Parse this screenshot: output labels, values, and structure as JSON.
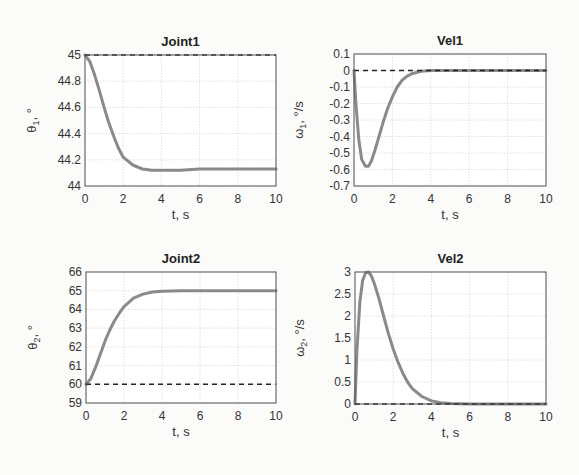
{
  "chart_data": [
    {
      "type": "line",
      "title": "Joint1",
      "xlabel": "t, s",
      "ylabel": "θ1, °",
      "xlim": [
        0,
        10
      ],
      "ylim": [
        44,
        45
      ],
      "xticks": [
        "0",
        "2",
        "4",
        "6",
        "8",
        "10"
      ],
      "yticks": [
        "44",
        "44.2",
        "44.4",
        "44.6",
        "44.8",
        "45"
      ],
      "grid": true,
      "series": [
        {
          "name": "actual",
          "style": "solid-gray",
          "x": [
            0,
            0.25,
            0.5,
            0.75,
            1,
            1.25,
            1.5,
            1.75,
            2,
            2.5,
            3,
            3.5,
            4,
            5,
            6,
            8,
            10
          ],
          "y": [
            45,
            44.95,
            44.85,
            44.73,
            44.6,
            44.48,
            44.38,
            44.29,
            44.22,
            44.16,
            44.13,
            44.12,
            44.12,
            44.12,
            44.13,
            44.13,
            44.13
          ]
        },
        {
          "name": "reference",
          "style": "dashed-black",
          "x": [
            0,
            10
          ],
          "y": [
            45,
            45
          ]
        }
      ]
    },
    {
      "type": "line",
      "title": "Vel1",
      "xlabel": "t, s",
      "ylabel": "ω1, °/s",
      "xlim": [
        0,
        10
      ],
      "ylim": [
        -0.7,
        0.1
      ],
      "xticks": [
        "0",
        "2",
        "4",
        "6",
        "8",
        "10"
      ],
      "yticks": [
        "-0.7",
        "-0.6",
        "-0.5",
        "-0.4",
        "-0.3",
        "-0.2",
        "-0.1",
        "0",
        "0.1"
      ],
      "grid": true,
      "series": [
        {
          "name": "actual",
          "style": "solid-gray",
          "x": [
            0,
            0.1,
            0.25,
            0.4,
            0.6,
            0.75,
            0.9,
            1.1,
            1.3,
            1.5,
            1.75,
            2,
            2.25,
            2.5,
            2.75,
            3,
            3.5,
            4,
            5,
            10
          ],
          "y": [
            0,
            -0.2,
            -0.42,
            -0.54,
            -0.58,
            -0.58,
            -0.55,
            -0.48,
            -0.4,
            -0.32,
            -0.23,
            -0.16,
            -0.1,
            -0.06,
            -0.035,
            -0.02,
            -0.005,
            0,
            0,
            0
          ]
        },
        {
          "name": "reference",
          "style": "dashed-black",
          "x": [
            0,
            10
          ],
          "y": [
            0,
            0
          ]
        }
      ]
    },
    {
      "type": "line",
      "title": "Joint2",
      "xlabel": "t, s",
      "ylabel": "θ2, °",
      "xlim": [
        0,
        10
      ],
      "ylim": [
        59,
        66
      ],
      "xticks": [
        "0",
        "2",
        "4",
        "6",
        "8",
        "10"
      ],
      "yticks": [
        "59",
        "60",
        "61",
        "62",
        "63",
        "64",
        "65",
        "66"
      ],
      "grid": true,
      "series": [
        {
          "name": "actual",
          "style": "solid-gray",
          "x": [
            0,
            0.25,
            0.5,
            0.75,
            1,
            1.25,
            1.5,
            1.75,
            2,
            2.5,
            3,
            3.5,
            4,
            5,
            6,
            8,
            10
          ],
          "y": [
            60,
            60.3,
            60.9,
            61.6,
            62.3,
            62.9,
            63.4,
            63.8,
            64.15,
            64.6,
            64.82,
            64.93,
            64.97,
            65,
            65,
            65,
            65
          ]
        },
        {
          "name": "reference",
          "style": "dashed-black",
          "x": [
            0,
            10
          ],
          "y": [
            60,
            60
          ]
        }
      ]
    },
    {
      "type": "line",
      "title": "Vel2",
      "xlabel": "t, s",
      "ylabel": "ω2, °/s",
      "xlim": [
        0,
        10
      ],
      "ylim": [
        0,
        3
      ],
      "xticks": [
        "0",
        "2",
        "4",
        "6",
        "8",
        "10"
      ],
      "yticks": [
        "0",
        "0.5",
        "1",
        "1.5",
        "2",
        "2.5",
        "3"
      ],
      "grid": true,
      "series": [
        {
          "name": "actual",
          "style": "solid-gray",
          "x": [
            0,
            0.1,
            0.25,
            0.4,
            0.55,
            0.7,
            0.85,
            1,
            1.25,
            1.5,
            1.75,
            2,
            2.25,
            2.5,
            2.75,
            3,
            3.5,
            4,
            4.5,
            5,
            6,
            10
          ],
          "y": [
            0,
            1.2,
            2.3,
            2.8,
            2.98,
            3,
            2.92,
            2.75,
            2.4,
            2.0,
            1.6,
            1.25,
            0.95,
            0.7,
            0.5,
            0.35,
            0.17,
            0.07,
            0.03,
            0.01,
            0,
            0
          ]
        },
        {
          "name": "reference",
          "style": "dashed-black",
          "x": [
            0,
            10
          ],
          "y": [
            0,
            0
          ]
        }
      ]
    }
  ],
  "plots": [
    {
      "title": "Joint1",
      "xlabel": "t, s",
      "ylabel_sym": "θ",
      "ylabel_sub": "1",
      "ylabel_unit": ", °"
    },
    {
      "title": "Vel1",
      "xlabel": "t, s",
      "ylabel_sym": "ω",
      "ylabel_sub": "1",
      "ylabel_unit": ", °/s"
    },
    {
      "title": "Joint2",
      "xlabel": "t, s",
      "ylabel_sym": "θ",
      "ylabel_sub": "2",
      "ylabel_unit": ", °"
    },
    {
      "title": "Vel2",
      "xlabel": "t, s",
      "ylabel_sym": "ω",
      "ylabel_sub": "2",
      "ylabel_unit": ", °/s"
    }
  ],
  "colors": {
    "actual": "#8a8a8a",
    "reference": "#222222",
    "grid": "#d8d8d8",
    "axis": "#555555"
  }
}
